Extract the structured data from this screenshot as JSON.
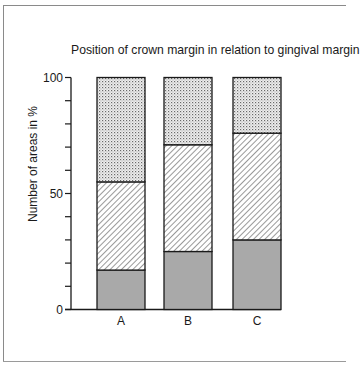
{
  "chart_data": {
    "type": "bar",
    "stacked": true,
    "title": "Position of crown margin in relation to gingival margin",
    "xlabel": "",
    "ylabel": "Number of areas in %",
    "ylim": [
      0,
      100
    ],
    "yticks_labeled": [
      0,
      50,
      100
    ],
    "yticks_minor_step": 10,
    "categories": [
      "A",
      "B",
      "C"
    ],
    "series": [
      {
        "name": "bottom (solid grey)",
        "pattern": "solid-grey",
        "values": [
          17,
          25,
          30
        ]
      },
      {
        "name": "middle (diagonal hatch)",
        "pattern": "diagonal-hatch",
        "values": [
          38,
          46,
          46
        ]
      },
      {
        "name": "top (dotted)",
        "pattern": "dotted",
        "values": [
          45,
          29,
          24
        ]
      }
    ],
    "legend": "none",
    "grid": false
  },
  "labels": {
    "title": "Position of crown margin in relation to gingival margin",
    "ylabel": "Number of areas in %",
    "y0": "0",
    "y50": "50",
    "y100": "100"
  },
  "colors": {
    "solid": "#a9a9a9",
    "hatch_line": "#555555",
    "dot": "#6a6a6a",
    "outline": "#1a1a1a"
  }
}
